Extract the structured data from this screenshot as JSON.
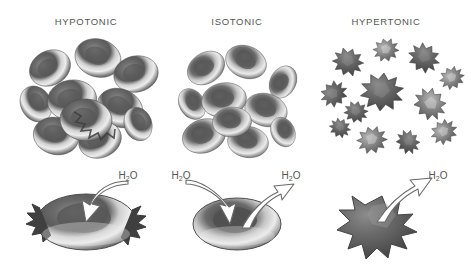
{
  "figure": {
    "title_implied": "Red blood cells in hypotonic, isotonic and hypertonic solutions",
    "background_color": "#ffffff",
    "ink_color": "#555555"
  },
  "columns": [
    {
      "id": "hypotonic",
      "label": "HYPOTONIC",
      "cluster_description": "cluster of swollen rounded red blood cells",
      "single_cell_description": "swollen red blood cell bursting with ragged edges",
      "water_flow": "in",
      "water_labels": [
        "H₂O"
      ]
    },
    {
      "id": "isotonic",
      "label": "ISOTONIC",
      "cluster_description": "cluster of normal biconcave disc red blood cells",
      "single_cell_description": "normal biconcave disc red blood cell",
      "water_flow": "in-and-out",
      "water_labels": [
        "H₂O",
        "H₂O"
      ]
    },
    {
      "id": "hypertonic",
      "label": "HYPERTONIC",
      "cluster_description": "cluster of shriveled spiky crenated red blood cells",
      "single_cell_description": "shriveled spiky crenated red blood cell",
      "water_flow": "out",
      "water_labels": [
        "H₂O"
      ]
    }
  ],
  "water": {
    "formula_h": "H",
    "formula_sub": "2",
    "formula_o": "O"
  },
  "colors": {
    "cell_dark": "#4f4f4f",
    "cell_mid": "#7d7d7d",
    "cell_light": "#b8b8b8",
    "cell_highlight": "#e2e2e2",
    "arrow_fill": "#ffffff",
    "arrow_stroke": "#6a6a6a",
    "text": "#555555",
    "background": "#ffffff"
  }
}
